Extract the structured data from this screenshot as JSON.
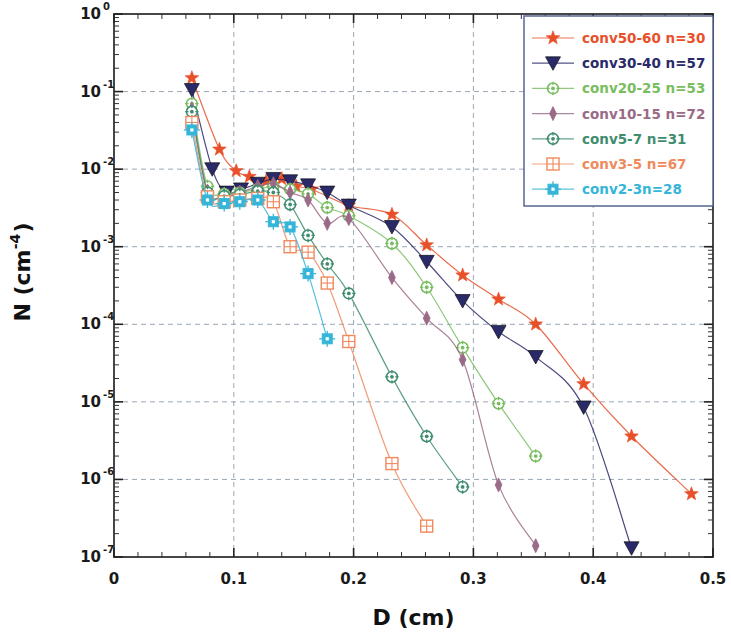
{
  "figure": {
    "background": "#ffffff",
    "plot_area": {
      "left": 114,
      "top": 14,
      "right": 713,
      "bottom": 557
    },
    "frame_color": "#333333",
    "grid_color": "#8a9aa8"
  },
  "axes": {
    "x": {
      "label": "D  (cm)",
      "min": 0,
      "max": 0.5,
      "ticks": [
        "0",
        "0.1",
        "0.2",
        "0.3",
        "0.4",
        "0.5"
      ],
      "tick_values": [
        0,
        0.1,
        0.2,
        0.3,
        0.4,
        0.5
      ],
      "minor_per_major": 5,
      "scale": "linear"
    },
    "y": {
      "label_n": "N",
      "label_unit": "(cm",
      "label_exp": "-4",
      "label_close": ")",
      "label": "N (cm-4)",
      "min": 1e-07,
      "max": 1,
      "scale": "log",
      "ticks": [
        "10",
        "10",
        "10",
        "10",
        "10",
        "10",
        "10",
        "10"
      ],
      "exponents": [
        "0",
        "-1",
        "-2",
        "-3",
        "-4",
        "-5",
        "-6",
        "-7"
      ],
      "tick_values": [
        1,
        0.1,
        0.01,
        0.001,
        0.0001,
        1e-05,
        1e-06,
        1e-07
      ]
    }
  },
  "legend": {
    "box": {
      "x": 524,
      "y": 16,
      "w": 189,
      "h": 190,
      "border": "#4a5a8a",
      "fill": "#ffffff"
    },
    "items": [
      {
        "label": "conv50-60 n=30",
        "color": "#e8502a",
        "marker": "star",
        "series": "conv50-60"
      },
      {
        "label": "conv30-40 n=57",
        "color": "#2a2a6a",
        "marker": "triangle-down",
        "series": "conv30-40"
      },
      {
        "label": "conv20-25 n=53",
        "color": "#79bd61",
        "marker": "circle-dot",
        "series": "conv20-25"
      },
      {
        "label": "conv10-15 n=72",
        "color": "#9a6a86",
        "marker": "diamond",
        "series": "conv10-15"
      },
      {
        "label": "conv5-7 n=31",
        "color": "#3f8d6e",
        "marker": "circle-dot",
        "series": "conv5-7"
      },
      {
        "label": "conv3-5 n=67",
        "color": "#f08a5d",
        "marker": "square-grid",
        "series": "conv3-5"
      },
      {
        "label": "conv2-3n=28",
        "color": "#35b5d8",
        "marker": "square-dot",
        "series": "conv2-3"
      }
    ]
  },
  "chart_data": {
    "type": "line",
    "title": "",
    "xlabel": "D  (cm)",
    "ylabel": "N (cm-4)",
    "xscale": "linear",
    "yscale": "log",
    "xlim": [
      0,
      0.5
    ],
    "ylim": [
      1e-07,
      1
    ],
    "grid": true,
    "legend_position": "upper-right",
    "series": [
      {
        "name": "conv50-60 n=30",
        "color": "#e8502a",
        "marker": "star",
        "x": [
          0.065,
          0.088,
          0.102,
          0.113,
          0.127,
          0.14,
          0.152,
          0.165,
          0.196,
          0.232,
          0.261,
          0.291,
          0.321,
          0.352,
          0.392,
          0.432,
          0.482
        ],
        "y": [
          0.15,
          0.018,
          0.0095,
          0.008,
          0.007,
          0.0075,
          0.006,
          0.0055,
          0.0034,
          0.0026,
          0.00105,
          0.00043,
          0.00021,
          0.0001,
          1.7e-05,
          3.6e-06,
          6.5e-07
        ]
      },
      {
        "name": "conv30-40 n=57",
        "color": "#2a2a6a",
        "marker": "triangle-down",
        "x": [
          0.065,
          0.082,
          0.094,
          0.106,
          0.12,
          0.133,
          0.147,
          0.162,
          0.178,
          0.196,
          0.232,
          0.261,
          0.291,
          0.321,
          0.352,
          0.392,
          0.432
        ],
        "y": [
          0.105,
          0.01,
          0.005,
          0.0055,
          0.0065,
          0.0075,
          0.007,
          0.0062,
          0.005,
          0.0034,
          0.0018,
          0.00064,
          0.0002,
          8e-05,
          3.8e-05,
          8.5e-06,
          1.3e-07
        ]
      },
      {
        "name": "conv20-25 n=53",
        "color": "#79bd61",
        "marker": "circle-dot",
        "x": [
          0.065,
          0.078,
          0.092,
          0.105,
          0.12,
          0.133,
          0.147,
          0.162,
          0.178,
          0.196,
          0.232,
          0.261,
          0.291,
          0.321,
          0.352
        ],
        "y": [
          0.07,
          0.006,
          0.0048,
          0.005,
          0.0055,
          0.006,
          0.0055,
          0.0048,
          0.0032,
          0.0025,
          0.0011,
          0.0003,
          5e-05,
          9.5e-06,
          2e-06
        ]
      },
      {
        "name": "conv10-15 n=72",
        "color": "#9a6a86",
        "marker": "diamond",
        "x": [
          0.065,
          0.078,
          0.092,
          0.105,
          0.12,
          0.133,
          0.147,
          0.162,
          0.178,
          0.196,
          0.232,
          0.261,
          0.291,
          0.321,
          0.352
        ],
        "y": [
          0.06,
          0.0052,
          0.0045,
          0.005,
          0.006,
          0.0065,
          0.005,
          0.004,
          0.002,
          0.0023,
          0.0004,
          0.00012,
          3.5e-05,
          8.5e-07,
          1.4e-07
        ]
      },
      {
        "name": "conv5-7 n=31",
        "color": "#3f8d6e",
        "marker": "circle-dot",
        "x": [
          0.065,
          0.078,
          0.092,
          0.105,
          0.12,
          0.133,
          0.147,
          0.162,
          0.178,
          0.196,
          0.232,
          0.261,
          0.291
        ],
        "y": [
          0.055,
          0.005,
          0.0045,
          0.0047,
          0.0052,
          0.005,
          0.0035,
          0.0014,
          0.0006,
          0.00025,
          2.1e-05,
          3.6e-06,
          8e-07
        ]
      },
      {
        "name": "conv3-5 n=67",
        "color": "#f08a5d",
        "marker": "square-grid",
        "x": [
          0.065,
          0.078,
          0.092,
          0.105,
          0.12,
          0.133,
          0.147,
          0.162,
          0.178,
          0.196,
          0.232,
          0.261
        ],
        "y": [
          0.04,
          0.0044,
          0.0038,
          0.004,
          0.0042,
          0.0038,
          0.001,
          0.00085,
          0.00034,
          6e-05,
          1.6e-06,
          2.5e-07
        ]
      },
      {
        "name": "conv2-3n=28",
        "color": "#35b5d8",
        "marker": "square-dot",
        "x": [
          0.065,
          0.078,
          0.092,
          0.105,
          0.12,
          0.133,
          0.147,
          0.162,
          0.178
        ],
        "y": [
          0.032,
          0.004,
          0.0036,
          0.0038,
          0.004,
          0.0021,
          0.0018,
          0.00045,
          6.5e-05
        ]
      }
    ]
  }
}
